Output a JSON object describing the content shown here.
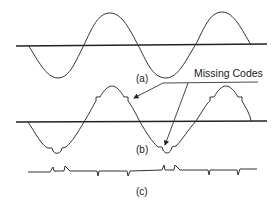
{
  "figure": {
    "panels": [
      {
        "id": "a",
        "label": "(a)",
        "description": "Ideal sine wave"
      },
      {
        "id": "b",
        "label": "(b)",
        "description": "Sine wave with missing codes (steps)"
      },
      {
        "id": "c",
        "label": "(c)",
        "description": "Error signal showing missing code spikes"
      }
    ],
    "annotation": {
      "text": "Missing Codes",
      "arrow_count": 2
    },
    "colors": {
      "line": "#333333",
      "axis": "#222222",
      "background": "#ffffff"
    }
  }
}
